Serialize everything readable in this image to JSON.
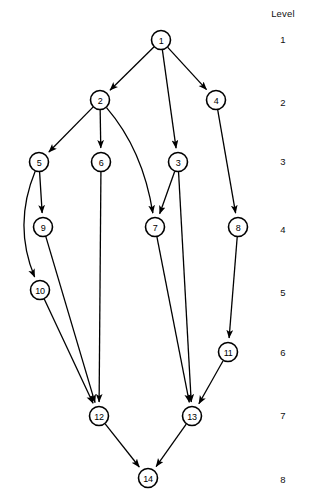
{
  "diagram": {
    "type": "directed-acyclic-graph",
    "node_radius": 9.5,
    "nodes": [
      {
        "id": "1",
        "label": "1",
        "x": 161,
        "y": 40,
        "level": 1
      },
      {
        "id": "2",
        "label": "2",
        "x": 100,
        "y": 100,
        "level": 2
      },
      {
        "id": "4",
        "label": "4",
        "x": 216,
        "y": 100,
        "level": 2
      },
      {
        "id": "5",
        "label": "5",
        "x": 39,
        "y": 162,
        "level": 3
      },
      {
        "id": "6",
        "label": "6",
        "x": 101,
        "y": 162,
        "level": 3
      },
      {
        "id": "3",
        "label": "3",
        "x": 178,
        "y": 162,
        "level": 3
      },
      {
        "id": "9",
        "label": "9",
        "x": 43,
        "y": 227,
        "level": 4
      },
      {
        "id": "7",
        "label": "7",
        "x": 155,
        "y": 227,
        "level": 4
      },
      {
        "id": "8",
        "label": "8",
        "x": 238,
        "y": 227,
        "level": 4
      },
      {
        "id": "10",
        "label": "10",
        "x": 40,
        "y": 290,
        "level": 5
      },
      {
        "id": "11",
        "label": "11",
        "x": 228,
        "y": 352,
        "level": 6
      },
      {
        "id": "12",
        "label": "12",
        "x": 99,
        "y": 416,
        "level": 7
      },
      {
        "id": "13",
        "label": "13",
        "x": 192,
        "y": 416,
        "level": 7
      },
      {
        "id": "14",
        "label": "14",
        "x": 148,
        "y": 478,
        "level": 8
      }
    ],
    "edges": [
      {
        "from": "1",
        "to": "2",
        "curve": null
      },
      {
        "from": "1",
        "to": "3",
        "curve": null
      },
      {
        "from": "1",
        "to": "4",
        "curve": null
      },
      {
        "from": "2",
        "to": "5",
        "curve": null
      },
      {
        "from": "2",
        "to": "6",
        "curve": null
      },
      {
        "from": "2",
        "to": "7",
        "curve": {
          "cx": 143,
          "cy": 150
        }
      },
      {
        "from": "3",
        "to": "7",
        "curve": null
      },
      {
        "from": "3",
        "to": "13",
        "curve": null
      },
      {
        "from": "4",
        "to": "8",
        "curve": null
      },
      {
        "from": "5",
        "to": "9",
        "curve": null
      },
      {
        "from": "5",
        "to": "10",
        "curve": {
          "cx": 13,
          "cy": 225
        }
      },
      {
        "from": "6",
        "to": "12",
        "curve": null
      },
      {
        "from": "7",
        "to": "13",
        "curve": null
      },
      {
        "from": "8",
        "to": "11",
        "curve": null
      },
      {
        "from": "9",
        "to": "12",
        "curve": null
      },
      {
        "from": "10",
        "to": "12",
        "curve": null
      },
      {
        "from": "11",
        "to": "13",
        "curve": null
      },
      {
        "from": "12",
        "to": "14",
        "curve": null
      },
      {
        "from": "13",
        "to": "14",
        "curve": null
      }
    ]
  },
  "level_axis": {
    "title": "Level",
    "title_y": 14,
    "ticks": [
      {
        "label": "1",
        "y": 40
      },
      {
        "label": "2",
        "y": 103
      },
      {
        "label": "3",
        "y": 162
      },
      {
        "label": "4",
        "y": 230
      },
      {
        "label": "5",
        "y": 293
      },
      {
        "label": "6",
        "y": 353
      },
      {
        "label": "7",
        "y": 416
      },
      {
        "label": "8",
        "y": 480
      }
    ]
  },
  "colors": {
    "background": "#ffffff",
    "stroke": "#000000",
    "node_fill": "#ffffff",
    "text": "#111111"
  }
}
